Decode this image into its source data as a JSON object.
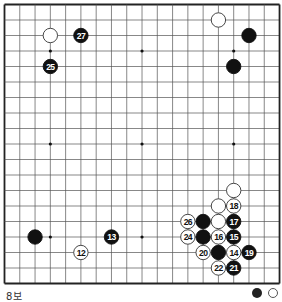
{
  "board": {
    "size": 19,
    "origin_x": 4.5,
    "origin_y": 4.5,
    "spacing_x": 15.28,
    "spacing_y": 15.5,
    "line_color": "#555555",
    "border_color": "#222222",
    "star_points": [
      [
        3,
        3
      ],
      [
        9,
        3
      ],
      [
        15,
        3
      ],
      [
        3,
        9
      ],
      [
        9,
        9
      ],
      [
        15,
        9
      ],
      [
        3,
        15
      ],
      [
        9,
        15
      ],
      [
        15,
        15
      ]
    ],
    "stones": [
      {
        "color": "white",
        "col": 3,
        "row": 2,
        "label": ""
      },
      {
        "color": "black",
        "col": 5,
        "row": 2,
        "label": "27"
      },
      {
        "color": "black",
        "col": 3,
        "row": 4,
        "label": "25"
      },
      {
        "color": "white",
        "col": 14,
        "row": 1,
        "label": ""
      },
      {
        "color": "black",
        "col": 16,
        "row": 2,
        "label": ""
      },
      {
        "color": "black",
        "col": 15,
        "row": 4,
        "label": ""
      },
      {
        "color": "black",
        "col": 2,
        "row": 15,
        "label": ""
      },
      {
        "color": "white",
        "col": 5,
        "row": 16,
        "label": "12"
      },
      {
        "color": "black",
        "col": 7,
        "row": 15,
        "label": "13"
      },
      {
        "color": "white",
        "col": 15,
        "row": 12,
        "label": ""
      },
      {
        "color": "white",
        "col": 14,
        "row": 13,
        "label": ""
      },
      {
        "color": "white",
        "col": 15,
        "row": 13,
        "label": "18"
      },
      {
        "color": "white",
        "col": 12,
        "row": 14,
        "label": "26"
      },
      {
        "color": "black",
        "col": 13,
        "row": 14,
        "label": ""
      },
      {
        "color": "white",
        "col": 14,
        "row": 14,
        "label": ""
      },
      {
        "color": "black",
        "col": 15,
        "row": 14,
        "label": "17"
      },
      {
        "color": "white",
        "col": 12,
        "row": 15,
        "label": "24"
      },
      {
        "color": "black",
        "col": 13,
        "row": 15,
        "label": ""
      },
      {
        "color": "white",
        "col": 14,
        "row": 15,
        "label": "16"
      },
      {
        "color": "black",
        "col": 15,
        "row": 15,
        "label": "15"
      },
      {
        "color": "white",
        "col": 13,
        "row": 16,
        "label": "20"
      },
      {
        "color": "black",
        "col": 14,
        "row": 16,
        "label": ""
      },
      {
        "color": "white",
        "col": 15,
        "row": 16,
        "label": "14"
      },
      {
        "color": "black",
        "col": 16,
        "row": 16,
        "label": "19"
      },
      {
        "color": "white",
        "col": 14,
        "row": 17,
        "label": "22"
      },
      {
        "color": "black",
        "col": 15,
        "row": 17,
        "label": "21"
      }
    ]
  },
  "caption": {
    "text": "8보"
  },
  "legend": {
    "icons": [
      "black-stone-icon",
      "white-stone-icon"
    ]
  }
}
